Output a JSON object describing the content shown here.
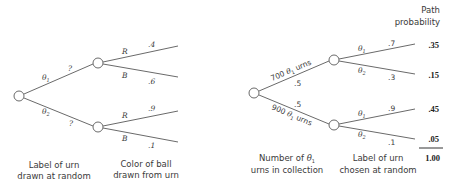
{
  "left_tree": {
    "stage1_branches": [
      {
        "label": "θ",
        "subscript": "1",
        "prob": "?"
      },
      {
        "label": "θ",
        "subscript": "2",
        "prob": "?"
      }
    ],
    "stage2_branches": [
      {
        "label": "R",
        "prob": ".4"
      },
      {
        "label": "B",
        "prob": ".6"
      },
      {
        "label": "R",
        "prob": ".9"
      },
      {
        "label": "B",
        "prob": ".1"
      }
    ],
    "captions": {
      "stage1_line1": "Label of urn",
      "stage1_line2": "drawn at random",
      "stage2_line1": "Color of ball",
      "stage2_line2": "drawn from urn"
    }
  },
  "right_tree": {
    "stage1_branches": [
      {
        "label_prefix": "700 ",
        "label_theta": "θ",
        "subscript": "1",
        "label_suffix": " urns",
        "prob": ".5"
      },
      {
        "label_prefix": "900 ",
        "label_theta": "θ",
        "subscript": "1",
        "label_suffix": " urns",
        "prob": ".5"
      }
    ],
    "stage2_branches": [
      {
        "label": "θ",
        "subscript": "1",
        "prob": ".7"
      },
      {
        "label": "θ",
        "subscript": "2",
        "prob": ".3"
      },
      {
        "label": "θ",
        "subscript": "1",
        "prob": ".9"
      },
      {
        "label": "θ",
        "subscript": "2",
        "prob": ".1"
      }
    ],
    "captions": {
      "stage1_line1_prefix": "Number of ",
      "stage1_line1_theta": "θ",
      "stage1_line1_sub": "1",
      "stage1_line2": "urns in collection",
      "stage2_line1": "Label of urn",
      "stage2_line2": "chosen at random"
    },
    "path_probability": {
      "header_line1": "Path",
      "header_line2": "probability",
      "values": [
        ".35",
        ".15",
        ".45",
        ".05"
      ],
      "total": "1.00"
    }
  }
}
